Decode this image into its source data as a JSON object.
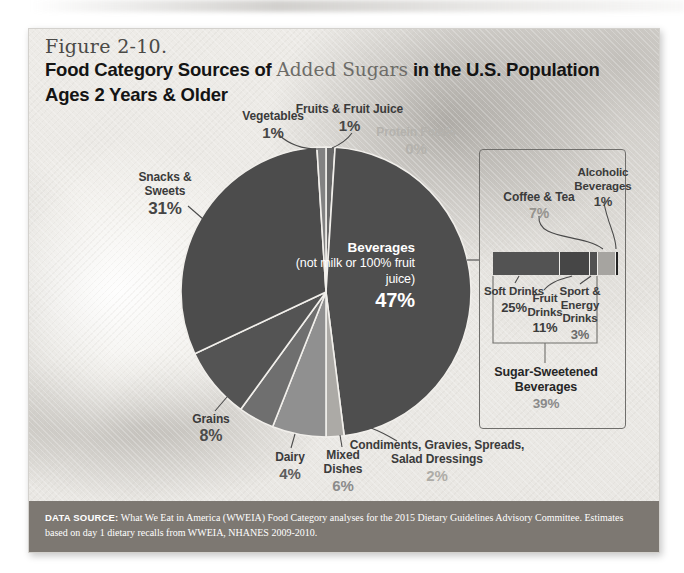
{
  "page": {
    "figure_label": "Figure 2-10.",
    "title": {
      "part1": "Food Category Sources of ",
      "accent": "Added Sugars",
      "part2": " in the U.S. Population",
      "line2": "Ages 2 Years & Older"
    }
  },
  "chart_data": [
    {
      "type": "pie",
      "title": "Food Category Sources of Added Sugars in the U.S. Population Ages 2 Years & Older",
      "units": "percent of total added sugars intake",
      "order": "clockwise from 12 o'clock",
      "slices": [
        {
          "id": "fruits-fruit-juice",
          "label": "Fruits & Fruit Juice",
          "pct": "1%",
          "value": 1,
          "color": "#686868"
        },
        {
          "id": "protein-foods",
          "label": "Protein Foods",
          "pct": "0%",
          "value": 0,
          "color": "#9a9a9a"
        },
        {
          "id": "beverages",
          "label": "Beverages",
          "sub": "(not milk or 100% fruit juice)",
          "pct": "47%",
          "value": 47,
          "color": "#4e4e4e"
        },
        {
          "id": "condiments",
          "label": "Condiments, Gravies, Spreads, Salad Dressings",
          "pct": "2%",
          "value": 2,
          "color": "#acaaa6"
        },
        {
          "id": "mixed-dishes",
          "label": "Mixed Dishes",
          "pct": "6%",
          "value": 6,
          "color": "#909090"
        },
        {
          "id": "dairy",
          "label": "Dairy",
          "pct": "4%",
          "value": 4,
          "color": "#6f6f6f"
        },
        {
          "id": "grains",
          "label": "Grains",
          "pct": "8%",
          "value": 8,
          "color": "#545454"
        },
        {
          "id": "snacks-sweets",
          "label": "Snacks & Sweets",
          "pct": "31%",
          "value": 31,
          "color": "#4c4c4c"
        },
        {
          "id": "vegetables",
          "label": "Vegetables",
          "pct": "1%",
          "value": 1,
          "color": "#828282"
        }
      ]
    },
    {
      "type": "bar",
      "subtype": "horizontal-stacked",
      "title": "Beverages breakdown",
      "total_label": "Sugar-Sweetened Beverages",
      "total_pct": "39%",
      "segments": [
        {
          "id": "soft-drinks",
          "label": "Soft Drinks",
          "pct": "25%",
          "value": 25,
          "color": "#535353"
        },
        {
          "id": "fruit-drinks",
          "label": "Fruit Drinks",
          "pct": "11%",
          "value": 11,
          "color": "#464646"
        },
        {
          "id": "sport-energy-drinks",
          "label": "Sport & Energy Drinks",
          "pct": "3%",
          "value": 3,
          "color": "#515151"
        },
        {
          "id": "coffee-tea",
          "label": "Coffee & Tea",
          "pct": "7%",
          "value": 7,
          "color": "#a6a4a0"
        },
        {
          "id": "alcoholic-beverages",
          "label": "Alcoholic Beverages",
          "pct": "1%",
          "value": 1,
          "color": "#232323"
        }
      ]
    }
  ],
  "footer": {
    "heading": "DATA SOURCE:",
    "text": "What We Eat in America (WWEIA) Food Category analyses for the 2015 Dietary Guidelines Advisory Committee. Estimates based on day 1 dietary recalls from WWEIA, NHANES 2009-2010."
  }
}
